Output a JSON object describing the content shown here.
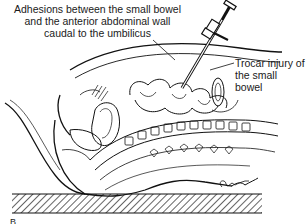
{
  "figure": {
    "panel_label": "B",
    "annotations": [
      {
        "id": "adhesions",
        "lines": [
          "Adhesions between the small bowel",
          "and the anterior abdominal wall",
          "caudal to the umbilicus"
        ]
      },
      {
        "id": "trocar-injury",
        "lines": [
          "Trocar injury of",
          "the small bowel"
        ]
      }
    ],
    "illustration": {
      "subject": "sagittal-section-pelvis-with-trocar",
      "elements": [
        "trocar-instrument",
        "abdominal-wall",
        "small-bowel-loops",
        "vertebral-column",
        "uterus",
        "bladder",
        "operating-table"
      ]
    },
    "colors": {
      "ink": "#111111",
      "background": "#ffffff"
    }
  }
}
